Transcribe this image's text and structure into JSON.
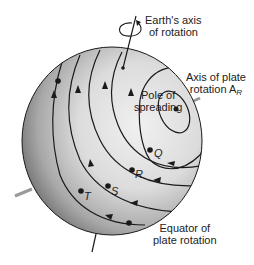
{
  "labels": {
    "earth_axis_line1": "Earth's axis",
    "earth_axis_line2": "of rotation",
    "plate_axis_line1": "Axis of plate",
    "plate_axis_line2": "rotation A",
    "plate_axis_sub": "R",
    "pole_line1": "Pole of",
    "pole_line2": "spreading",
    "equator_line1": "Equator of",
    "equator_line2": "plate rotation"
  },
  "points": {
    "Q": "Q",
    "R": "R",
    "S": "S",
    "T": "T"
  },
  "colors": {
    "sphere_light": "#e6e6e6",
    "sphere_dark": "#6e6e6e",
    "line": "#1a1a1a",
    "axis_gray": "#9a9a9a"
  }
}
